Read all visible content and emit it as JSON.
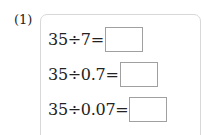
{
  "problem": {
    "label": "(1)",
    "rows": [
      {
        "expression": "35÷7=",
        "answer": ""
      },
      {
        "expression": "35÷0.7=",
        "answer": ""
      },
      {
        "expression": "35÷0.07=",
        "answer": ""
      }
    ]
  }
}
